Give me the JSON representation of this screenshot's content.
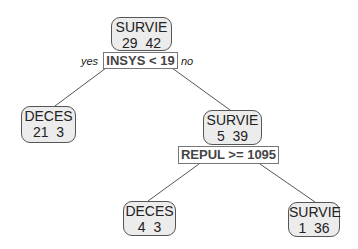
{
  "tree": {
    "root": {
      "class": "SURVIE",
      "counts": "29  42",
      "split": "INSYS < 19",
      "yes_label": "yes",
      "no_label": "no"
    },
    "left_leaf": {
      "class": "DECES",
      "counts": "21  3"
    },
    "right_node": {
      "class": "SURVIE",
      "counts": "5  39",
      "split": "REPUL >= 1095"
    },
    "right_left_leaf": {
      "class": "DECES",
      "counts": "4  3"
    },
    "right_right_leaf": {
      "class": "SURVIE",
      "counts": "1  36"
    }
  },
  "colors": {
    "node_fill": "#ececec",
    "node_border": "#555555",
    "edge": "#555555",
    "split_border": "#777777"
  }
}
